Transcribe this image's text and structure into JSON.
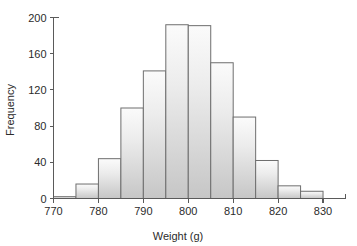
{
  "chart_data": {
    "type": "bar",
    "title": "",
    "subtitle": "",
    "xlabel": "Weight (g)",
    "ylabel": "Frequency",
    "xlim": [
      770,
      835
    ],
    "ylim": [
      0,
      200
    ],
    "grid": false,
    "legend": null,
    "bin_width": 5,
    "bin_edges": [
      770,
      775,
      780,
      785,
      790,
      795,
      800,
      805,
      810,
      815,
      820,
      825,
      830
    ],
    "categories": [
      "770-775",
      "775-780",
      "780-785",
      "785-790",
      "790-795",
      "795-800",
      "800-805",
      "805-810",
      "810-815",
      "815-820",
      "820-825",
      "825-830"
    ],
    "values": [
      2,
      16,
      44,
      100,
      141,
      192,
      191,
      150,
      90,
      42,
      14,
      8
    ],
    "xticks": [
      770,
      780,
      790,
      800,
      810,
      820,
      830
    ],
    "xtick_labels": [
      "770",
      "780",
      "790",
      "800",
      "810",
      "820",
      "830"
    ],
    "yticks": [
      0,
      40,
      80,
      120,
      160,
      200
    ],
    "ytick_labels": [
      "0",
      "40",
      "80",
      "120",
      "160",
      "200"
    ],
    "bar_fill_top": "#fbfbfb",
    "bar_fill_bottom": "#c6c6c6",
    "bar_edge_color": "#6e6e6e",
    "axis_color": "#5a5a5a",
    "text_color": "#2b2b2b",
    "background": "#ffffff"
  }
}
